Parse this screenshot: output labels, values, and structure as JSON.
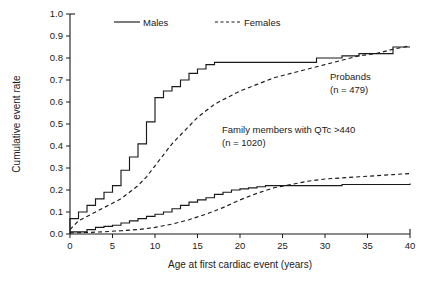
{
  "chart_data": {
    "type": "line",
    "title": "",
    "xlabel": "Age at first cardiac event (years)",
    "ylabel": "Cumulative event rate",
    "xlim": [
      0,
      40
    ],
    "ylim": [
      0,
      1.0
    ],
    "xticks": [
      "0",
      "5",
      "10",
      "15",
      "20",
      "25",
      "30",
      "35",
      "40"
    ],
    "yticks": [
      "0.0",
      "0.1",
      "0.2",
      "0.3",
      "0.4",
      "0.5",
      "0.6",
      "0.7",
      "0.8",
      "0.9",
      "1.0"
    ],
    "grid": false,
    "legend_position": "top-center",
    "legend": [
      {
        "label": "Males",
        "style": "solid"
      },
      {
        "label": "Females",
        "style": "dashed"
      }
    ],
    "annotations": [
      {
        "id": "probands",
        "line1": "Probands",
        "line2": "(n = 479)"
      },
      {
        "id": "family-members",
        "line1": "Family members with QTc >440",
        "line2": "(n = 1020)"
      }
    ],
    "series": [
      {
        "name": "Probands - Males",
        "group": "Probands",
        "sex": "Males",
        "style": "solid",
        "step": true,
        "x": [
          0,
          0,
          1,
          2,
          3,
          4,
          5,
          6,
          7,
          8,
          9,
          10,
          11,
          12,
          13,
          14,
          15,
          16,
          17,
          18,
          29,
          32,
          34,
          38,
          40
        ],
        "y": [
          0.0,
          0.07,
          0.1,
          0.13,
          0.16,
          0.19,
          0.22,
          0.29,
          0.35,
          0.41,
          0.51,
          0.62,
          0.65,
          0.67,
          0.7,
          0.73,
          0.75,
          0.77,
          0.78,
          0.78,
          0.8,
          0.81,
          0.82,
          0.85,
          0.85
        ]
      },
      {
        "name": "Probands - Females",
        "group": "Probands",
        "sex": "Females",
        "style": "dashed",
        "step": false,
        "x": [
          0,
          1,
          2,
          3,
          4,
          5,
          6,
          7,
          8,
          9,
          10,
          11,
          12,
          13,
          14,
          15,
          16,
          17,
          18,
          20,
          22,
          24,
          26,
          28,
          30,
          32,
          34,
          36,
          38,
          40
        ],
        "y": [
          0.02,
          0.06,
          0.08,
          0.1,
          0.12,
          0.14,
          0.16,
          0.19,
          0.22,
          0.26,
          0.31,
          0.36,
          0.41,
          0.45,
          0.49,
          0.53,
          0.56,
          0.59,
          0.61,
          0.65,
          0.68,
          0.71,
          0.73,
          0.75,
          0.77,
          0.79,
          0.81,
          0.82,
          0.84,
          0.855
        ]
      },
      {
        "name": "Family members - Males",
        "group": "Family members with QTc >440",
        "sex": "Males",
        "style": "solid",
        "step": true,
        "x": [
          0,
          1,
          2,
          3,
          4,
          5,
          6,
          7,
          8,
          9,
          10,
          11,
          12,
          13,
          14,
          15,
          16,
          17,
          18,
          19,
          20,
          21,
          22,
          23,
          32,
          40
        ],
        "y": [
          0.01,
          0.01,
          0.02,
          0.03,
          0.035,
          0.04,
          0.05,
          0.06,
          0.07,
          0.08,
          0.09,
          0.1,
          0.115,
          0.13,
          0.145,
          0.155,
          0.165,
          0.18,
          0.19,
          0.2,
          0.205,
          0.21,
          0.215,
          0.22,
          0.225,
          0.23
        ]
      },
      {
        "name": "Family members - Females",
        "group": "Family members with QTc >440",
        "sex": "Females",
        "style": "dashed",
        "step": false,
        "x": [
          0,
          2,
          4,
          6,
          8,
          10,
          12,
          14,
          16,
          18,
          20,
          22,
          24,
          26,
          28,
          30,
          32,
          34,
          36,
          38,
          40
        ],
        "y": [
          0.005,
          0.007,
          0.01,
          0.015,
          0.02,
          0.03,
          0.045,
          0.065,
          0.09,
          0.12,
          0.155,
          0.185,
          0.21,
          0.225,
          0.24,
          0.25,
          0.255,
          0.26,
          0.265,
          0.27,
          0.275
        ]
      }
    ]
  },
  "geometry": {
    "plot_left": 70,
    "plot_right": 410,
    "plot_top": 14,
    "plot_bottom": 234
  }
}
